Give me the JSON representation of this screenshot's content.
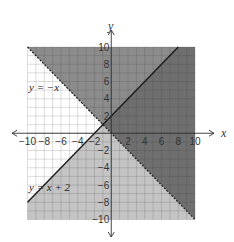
{
  "chart_data": {
    "type": "line",
    "title": "",
    "xlabel": "x",
    "ylabel": "y",
    "xlim": [
      -10,
      10
    ],
    "ylim": [
      -10,
      10
    ],
    "grid": true,
    "x_ticks": [
      -10,
      -8,
      -6,
      -4,
      -2,
      2,
      4,
      6,
      8,
      10
    ],
    "y_ticks": [
      -10,
      -8,
      -6,
      -4,
      -2,
      2,
      4,
      6,
      8,
      10
    ],
    "x_tick_labels": [
      "−10",
      "−8",
      "−6",
      "−4",
      "−2",
      "2",
      "4",
      "6",
      "8",
      "10"
    ],
    "y_tick_labels": [
      "−10",
      "−8",
      "−6",
      "−4",
      "−2",
      "2",
      "4",
      "6",
      "8",
      "10"
    ],
    "series": [
      {
        "name": "y = −x",
        "style": "dashed",
        "slope": -1,
        "intercept": 0,
        "x": [
          -10,
          10
        ],
        "y": [
          10,
          -10
        ],
        "shading": "above"
      },
      {
        "name": "y = x + 2",
        "style": "solid",
        "slope": 1,
        "intercept": 2,
        "x": [
          -10,
          8
        ],
        "y": [
          -8,
          10
        ],
        "shading": "below"
      }
    ],
    "annotations": [
      {
        "text": "y = −x",
        "x": -9.6,
        "y": 5.5
      },
      {
        "text": "y = x + 2",
        "x": -9.6,
        "y": -6
      }
    ],
    "regions": [
      {
        "name": "overlap-solution",
        "color": "#6f6f6f"
      },
      {
        "name": "above-both",
        "color": "#8c8c8c"
      },
      {
        "name": "below-both",
        "color": "#c4c4c4"
      },
      {
        "name": "unshaded",
        "color": "#ffffff"
      }
    ]
  },
  "labels": {
    "x_axis": "x",
    "y_axis": "y",
    "line1": "y = −x",
    "line2": "y = x + 2"
  }
}
